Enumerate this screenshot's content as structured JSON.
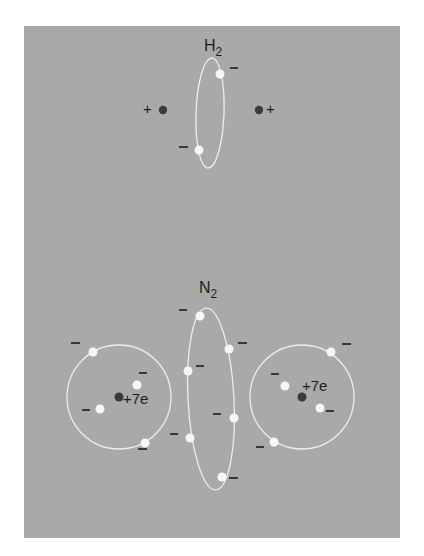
{
  "colors": {
    "page_background": "#ffffff",
    "panel_background": "#a9a9a9",
    "nucleus": "#3a3a3a",
    "electron": "#f6f6f6",
    "orbit": "#ededed",
    "text": "#1e1e1e"
  },
  "h2": {
    "label": "H",
    "subscript": "2",
    "nucleus_charge_left": "+",
    "nucleus_charge_right": "+",
    "electron_charge": "−"
  },
  "n2": {
    "label": "N",
    "subscript": "2",
    "left_atom_charge": "+7e",
    "right_atom_charge": "+7e",
    "electron_charge": "−"
  }
}
